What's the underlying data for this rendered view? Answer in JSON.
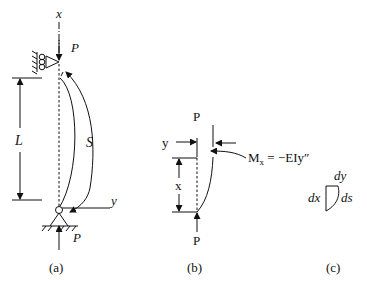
{
  "figure": {
    "panel_a": {
      "caption": "(a)",
      "axis_x_label": "x",
      "axis_y_label": "y",
      "load_top_label": "P",
      "load_bottom_label": "P",
      "length_label": "L",
      "arc_label": "S"
    },
    "panel_b": {
      "caption": "(b)",
      "load_top_label": "P",
      "load_bottom_label": "P",
      "y_label": "y",
      "x_label": "x",
      "moment_label": "M",
      "moment_subscript": "x",
      "moment_equation": " = −EIy″"
    },
    "panel_c": {
      "caption": "(c)",
      "dy_label": "dy",
      "dx_label": "dx",
      "ds_label": "ds"
    }
  }
}
